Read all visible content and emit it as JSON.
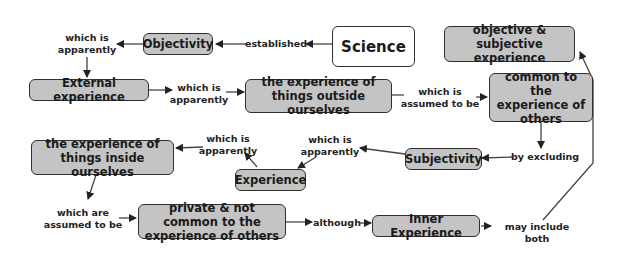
{
  "diagram": {
    "type": "concept-map",
    "colors": {
      "node_fill": "#c4c4c4",
      "root_fill": "#ffffff",
      "border": "#2f2f2f",
      "text": "#1a1a1a"
    },
    "nodes": {
      "science": "Science",
      "objectivity": "Objectivity",
      "external_experience": "External experience",
      "things_outside": "the experience of things outside ourselves",
      "common_to_others": "common to the experience of others",
      "obj_subj": "objective & subjective experience",
      "subjectivity": "Subjectivity",
      "experience": "Experience",
      "things_inside": "the experience of things inside ourselves",
      "private": "private & not common to the experience of others",
      "inner_experience": "Inner Experience"
    },
    "links": {
      "established": "established",
      "apparently_1": "which is\napparently",
      "apparently_2": "which is\napparently",
      "assumed_1": "which is\nassumed to be",
      "by_excluding": "by excluding",
      "apparently_3": "which is\napparently",
      "apparently_4": "which is\napparently",
      "assumed_2": "which are\nassumed to be",
      "although": "although",
      "may_include": "may include both"
    }
  }
}
